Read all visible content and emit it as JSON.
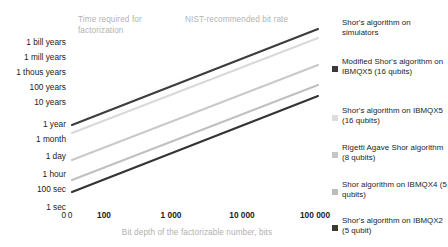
{
  "chart_data": {
    "type": "line",
    "title": "",
    "xlabel": "Bit depth of the factorizable number, bits",
    "ylabel": "",
    "x_scale": "log",
    "y_scale": "log",
    "grid": false,
    "legend_position": "right",
    "xticks": [
      "0",
      "100",
      "1 000",
      "10 000",
      "100 000"
    ],
    "yticks": [
      "1 bill years",
      "1 mill years",
      "1 thous years",
      "100 years",
      "10 years",
      "1 year",
      "1 month",
      "1 day",
      "1 hour",
      "100 sec",
      "1 sec",
      "0"
    ],
    "annotations": [
      {
        "text": "Time required for factorization"
      },
      {
        "text": "NIST-recommended bit rate"
      }
    ],
    "series": [
      {
        "name": "Shor's algorithm on simulators",
        "color": "#ffffff",
        "x": [
          100,
          100000
        ],
        "y_labels": [
          "1 year",
          "above 1 bill years"
        ]
      },
      {
        "name": "Modified Shor's algorithm on IBMQX5 (16 qubits)",
        "color": "#3a3a3a",
        "x": [
          100,
          100000
        ],
        "y_labels": [
          "1 year",
          "above 1 bill years"
        ]
      },
      {
        "name": "Shor's algorithm on IBMQX5 (16 qubits)",
        "color": "#d6d6d6",
        "x": [
          100,
          100000
        ],
        "y_labels": [
          "1 month",
          "1 bill years"
        ]
      },
      {
        "name": "Rigetti Agave Shor algorithm (8 qubits)",
        "color": "#c2c2c2",
        "x": [
          100,
          100000
        ],
        "y_labels": [
          "1 day",
          "100 years"
        ]
      },
      {
        "name": "Shor algorithm on IBMQX4 (5 qubits)",
        "color": "#b6b6b6",
        "x": [
          100,
          100000
        ],
        "y_labels": [
          "100 sec",
          "10 years"
        ]
      },
      {
        "name": "Shor's algorithm on IBMQX2 (5 qubit)",
        "color": "#2f2f2f",
        "x": [
          100,
          100000
        ],
        "y_labels": [
          "1 sec",
          "1 year"
        ]
      }
    ]
  },
  "axes": {
    "y_labels": [
      {
        "text": "1 bill years",
        "top": 38
      },
      {
        "text": "1 mill years",
        "top": 53
      },
      {
        "text": "1 thous years",
        "top": 68
      },
      {
        "text": "100 years",
        "top": 83
      },
      {
        "text": "10 years",
        "top": 98
      },
      {
        "text": "1 year",
        "top": 120
      },
      {
        "text": "1 month",
        "top": 135
      },
      {
        "text": "1 day",
        "top": 152
      },
      {
        "text": "1 hour",
        "top": 170
      },
      {
        "text": "100 sec",
        "top": 185
      },
      {
        "text": "1 sec",
        "top": 203
      },
      {
        "text": "0",
        "top": 211
      }
    ],
    "x_labels": [
      {
        "text": "0",
        "left": 70,
        "bold": false
      },
      {
        "text": "100",
        "left": 104,
        "bold": true
      },
      {
        "text": "1 000",
        "left": 171,
        "bold": true
      },
      {
        "text": "10 000",
        "left": 242,
        "bold": true
      },
      {
        "text": "100 000",
        "left": 315,
        "bold": true
      }
    ],
    "x_title": "Bit depth of the factorizable number, bits"
  },
  "annotations": {
    "time_required": "Time required for factorization",
    "nist_rate": "NIST-recommended bit rate"
  },
  "legend": {
    "items": [
      {
        "label": "Shor's algorithm on simulators",
        "color": "#ffffff",
        "top": 0
      },
      {
        "label": "Modified Shor's algorithm on IBMQX5 (16 qubits)",
        "color": "#3a3a3a",
        "top": 39
      },
      {
        "label": "Shor's algorithm on IBMQX5 (16 qubits)",
        "color": "#dcdcdc",
        "top": 88
      },
      {
        "label": "Rigetti Agave Shor algorithm (8 qubits)",
        "color": "#c6c6c6",
        "top": 125
      },
      {
        "label": "Shor algorithm on IBMQX4 (5 qubits)",
        "color": "#bcbcbc",
        "top": 162
      },
      {
        "label": "Shor's algorithm on IBMQX2 (5 qubit)",
        "color": "#3a3a3a",
        "top": 198
      }
    ]
  },
  "colors": {
    "text_dark": "#1b1b1b",
    "text_muted": "#b3b3b3",
    "background": "#ffffff"
  }
}
